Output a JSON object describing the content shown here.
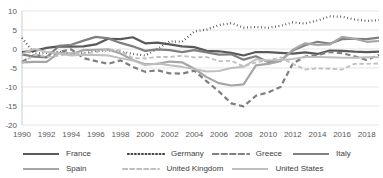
{
  "chart_data": {
    "type": "line",
    "title": "",
    "xlabel": "",
    "ylabel": "",
    "xlim": [
      1990,
      2019
    ],
    "ylim": [
      -20,
      10
    ],
    "grid": true,
    "legend_position": "bottom",
    "x": [
      1990,
      1991,
      1992,
      1993,
      1994,
      1995,
      1996,
      1997,
      1998,
      1999,
      2000,
      2001,
      2002,
      2003,
      2004,
      2005,
      2006,
      2007,
      2008,
      2009,
      2010,
      2011,
      2012,
      2013,
      2014,
      2015,
      2016,
      2017,
      2018,
      2019
    ],
    "xticks": [
      "1990",
      "1992",
      "1994",
      "1996",
      "1998",
      "2000",
      "2002",
      "2004",
      "2006",
      "2008",
      "2010",
      "2012",
      "2014",
      "2016",
      "2018"
    ],
    "yticks": [
      "10",
      "5",
      "0",
      "-5",
      "-10",
      "-15",
      "-20"
    ],
    "series": [
      {
        "name": "France",
        "style": "solid",
        "color": "#595959",
        "width": 2.2,
        "values": [
          -0.8,
          -0.5,
          0.3,
          0.7,
          0.6,
          0.7,
          1.2,
          2.7,
          2.6,
          3.1,
          1.5,
          1.7,
          1.2,
          0.7,
          0.5,
          -0.5,
          -0.6,
          -1.0,
          -1.7,
          -0.8,
          -0.8,
          -1.0,
          -1.2,
          -0.9,
          -1.3,
          -0.4,
          -0.5,
          -0.7,
          -0.8,
          -0.7
        ]
      },
      {
        "name": "Germany",
        "style": "dotted",
        "color": "#404040",
        "width": 2.2,
        "values": [
          2.9,
          -1.2,
          -1.0,
          -0.7,
          -1.3,
          -1.1,
          -0.5,
          -0.4,
          -0.7,
          -1.3,
          -1.7,
          0.0,
          2.0,
          1.9,
          4.6,
          5.1,
          6.3,
          6.8,
          5.6,
          5.8,
          5.6,
          6.1,
          7.0,
          6.7,
          7.5,
          8.6,
          8.5,
          7.8,
          7.4,
          7.6
        ]
      },
      {
        "name": "Greece",
        "style": "dashed",
        "color": "#7f7f7f",
        "width": 2.2,
        "values": [
          -3.4,
          -1.5,
          -2.1,
          -0.8,
          -0.1,
          -2.4,
          -3.2,
          -3.9,
          -3.0,
          -4.7,
          -6.0,
          -5.6,
          -6.4,
          -6.5,
          -5.7,
          -8.5,
          -11.2,
          -14.3,
          -15.1,
          -12.3,
          -11.4,
          -10.0,
          -3.8,
          -2.0,
          -1.6,
          -0.8,
          -1.1,
          -1.9,
          -2.9,
          -1.5
        ]
      },
      {
        "name": "Italy",
        "style": "solid",
        "color": "#808080",
        "width": 2.2,
        "values": [
          -1.4,
          -2.0,
          -2.2,
          0.8,
          1.1,
          2.2,
          3.2,
          2.8,
          1.6,
          0.7,
          -0.5,
          -0.1,
          -0.3,
          -0.8,
          -0.3,
          -0.9,
          -1.5,
          -1.4,
          -2.8,
          -1.9,
          -3.4,
          -3.0,
          -0.4,
          1.0,
          1.9,
          1.4,
          2.6,
          2.7,
          2.6,
          3.0
        ]
      },
      {
        "name": "Spain",
        "style": "solid",
        "color": "#a6a6a6",
        "width": 2.2,
        "values": [
          -3.5,
          -3.4,
          -3.4,
          -1.0,
          -1.3,
          -0.3,
          -0.2,
          -0.1,
          -1.2,
          -2.9,
          -4.0,
          -3.9,
          -3.3,
          -3.5,
          -5.2,
          -7.4,
          -9.0,
          -9.6,
          -9.3,
          -4.3,
          -3.9,
          -3.2,
          -0.2,
          1.5,
          1.1,
          1.2,
          3.2,
          2.7,
          1.9,
          2.1
        ]
      },
      {
        "name": "United Kingdom",
        "style": "dashed",
        "color": "#bfbfbf",
        "width": 1.8,
        "values": [
          -3.8,
          -1.5,
          -2.0,
          -1.8,
          -1.0,
          -1.2,
          -0.8,
          -0.1,
          -0.4,
          -2.4,
          -2.5,
          -2.1,
          -2.1,
          -1.8,
          -2.2,
          -2.1,
          -3.2,
          -3.1,
          -4.6,
          -3.5,
          -3.0,
          -2.2,
          -3.9,
          -5.4,
          -5.1,
          -5.2,
          -5.4,
          -3.9,
          -3.9,
          -3.8
        ]
      },
      {
        "name": "United States",
        "style": "solid",
        "color": "#bfbfbf",
        "width": 2.0,
        "values": [
          -1.3,
          0.0,
          -0.8,
          -1.2,
          -1.7,
          -1.5,
          -1.6,
          -1.7,
          -2.4,
          -3.0,
          -4.2,
          -3.8,
          -4.3,
          -4.7,
          -5.3,
          -5.9,
          -5.8,
          -5.0,
          -4.7,
          -2.7,
          -3.0,
          -2.9,
          -2.6,
          -2.1,
          -2.1,
          -2.2,
          -2.3,
          -2.3,
          -2.2,
          -2.2
        ]
      }
    ]
  },
  "legend": {
    "rows": [
      [
        {
          "label": "France",
          "swatch": "solid-dark-thick"
        },
        {
          "label": "Germany",
          "swatch": "dotted"
        },
        {
          "label": "Greece",
          "swatch": "dashed"
        },
        {
          "label": "Italy",
          "swatch": "solid-medium"
        }
      ],
      [
        {
          "label": "Spain",
          "swatch": "solid-gray"
        },
        {
          "label": "United Kingdom",
          "swatch": "dashed-light"
        },
        {
          "label": "United States",
          "swatch": "solid-light"
        }
      ]
    ]
  }
}
